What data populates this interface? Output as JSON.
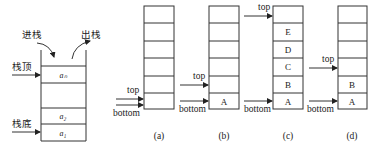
{
  "concept_diagram": {
    "push_label": "进栈",
    "pop_label": "出栈",
    "top_label": "栈顶",
    "bottom_label": "栈底",
    "cells": {
      "top": "aₙ",
      "second": "a₂",
      "first": "a₁"
    }
  },
  "stacks": [
    {
      "caption": "(a)",
      "top_label": "top",
      "bottom_label": "bottom",
      "cells": [
        "",
        "",
        "",
        "",
        "",
        ""
      ]
    },
    {
      "caption": "(b)",
      "top_label": "top",
      "bottom_label": "bottom",
      "cells": [
        "",
        "",
        "",
        "",
        "",
        "A"
      ]
    },
    {
      "caption": "(c)",
      "top_label": "top",
      "bottom_label": "bottom",
      "cells": [
        "",
        "E",
        "D",
        "C",
        "B",
        "A"
      ]
    },
    {
      "caption": "(d)",
      "top_label": "top",
      "bottom_label": "bottom",
      "cells": [
        "",
        "",
        "",
        "",
        "B",
        "A"
      ]
    }
  ],
  "colors": {
    "line": "#333333",
    "text": "#222222",
    "background": "#ffffff"
  }
}
